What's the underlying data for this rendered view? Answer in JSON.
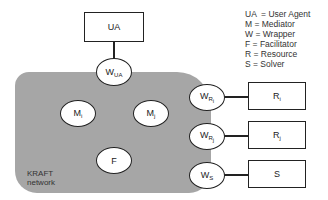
{
  "diagram": {
    "nodes": {
      "user_agent": {
        "label": "UA"
      },
      "wrapper_ua": {
        "base": "W",
        "sub": "UA"
      },
      "mediator_i": {
        "base": "M",
        "sub": "i"
      },
      "mediator_j": {
        "base": "M",
        "sub": "j"
      },
      "facilitator": {
        "label": "F"
      },
      "wrapper_ri": {
        "base": "W",
        "sub": "R",
        "subsub": "i"
      },
      "wrapper_rj": {
        "base": "W",
        "sub": "R",
        "subsub": "j"
      },
      "wrapper_s": {
        "base": "W",
        "sub": "S"
      },
      "resource_i": {
        "base": "R",
        "sub": "i"
      },
      "resource_j": {
        "base": "R",
        "sub": "j"
      },
      "solver": {
        "label": "S"
      }
    },
    "network": {
      "label_line1": "KRAFT",
      "label_line2": "network",
      "fill": "#a6a6a6"
    },
    "edges": [
      [
        "user_agent",
        "wrapper_ua"
      ],
      [
        "wrapper_ri",
        "resource_i"
      ],
      [
        "wrapper_rj",
        "resource_j"
      ],
      [
        "wrapper_s",
        "solver"
      ]
    ],
    "legend": [
      "UA  = User Agent",
      "M = Mediator",
      "W = Wrapper",
      "F = Facilitator",
      "R = Resource",
      "S = Solver"
    ]
  }
}
